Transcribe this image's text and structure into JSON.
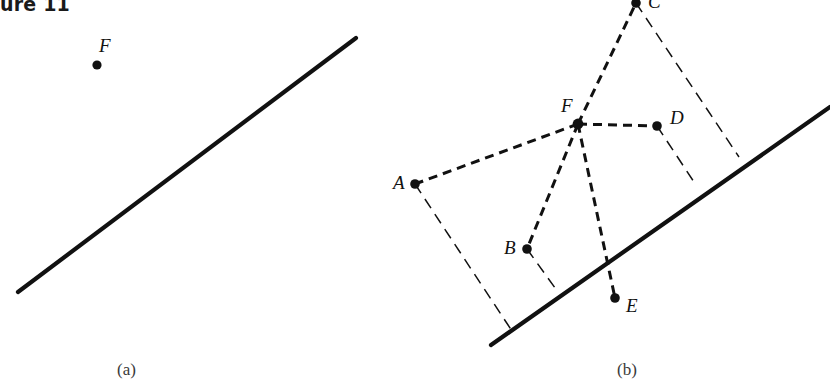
{
  "figure": {
    "title": "ure 11",
    "title_full": "Figure 11",
    "width": 830,
    "height": 388,
    "background": "#ffffff",
    "ink_color": "#111111"
  },
  "panels": [
    {
      "id": "a",
      "caption": "(a)",
      "caption_x": 117,
      "caption_y": 361,
      "line": {
        "name": "reference-line-a",
        "x1": 18,
        "y1": 292,
        "x2": 356,
        "y2": 38,
        "style": "solid",
        "width": 4.2
      },
      "points": [
        {
          "label": "F",
          "x": 97,
          "y": 65,
          "label_x": 99,
          "label_y": 36,
          "r": 4.6
        }
      ]
    },
    {
      "id": "b",
      "caption": "(b)",
      "caption_x": 617,
      "caption_y": 361,
      "line": {
        "name": "reference-line-b",
        "x1": 491,
        "y1": 345,
        "x2": 830,
        "y2": 107,
        "style": "solid",
        "width": 4.2
      },
      "points": [
        {
          "label": "A",
          "x": 415,
          "y": 184,
          "label_x": 393,
          "label_y": 173,
          "r": 4.8
        },
        {
          "label": "B",
          "x": 527,
          "y": 249,
          "label_x": 504,
          "label_y": 238,
          "r": 4.8
        },
        {
          "label": "C",
          "x": 636,
          "y": 3,
          "label_x": 648,
          "label_y": -8,
          "r": 4.8
        },
        {
          "label": "D",
          "x": 657,
          "y": 126,
          "label_x": 670,
          "label_y": 108,
          "r": 4.8
        },
        {
          "label": "E",
          "x": 615,
          "y": 298,
          "label_x": 626,
          "label_y": 296,
          "r": 4.8
        },
        {
          "label": "F",
          "x": 578,
          "y": 124,
          "label_x": 561,
          "label_y": 96,
          "r": 5.4
        }
      ],
      "rays_from_F": [
        {
          "name": "ray-F-A",
          "to": "A",
          "x1": 578,
          "y1": 124,
          "x2": 415,
          "y2": 184
        },
        {
          "name": "ray-F-B",
          "to": "B",
          "x1": 578,
          "y1": 124,
          "x2": 527,
          "y2": 249
        },
        {
          "name": "ray-F-C",
          "to": "C",
          "x1": 578,
          "y1": 124,
          "x2": 636,
          "y2": 3
        },
        {
          "name": "ray-F-D",
          "to": "D",
          "x1": 578,
          "y1": 124,
          "x2": 657,
          "y2": 126
        },
        {
          "name": "ray-F-E",
          "to": "E",
          "x1": 578,
          "y1": 124,
          "x2": 615,
          "y2": 298
        }
      ],
      "perpendiculars": [
        {
          "name": "perp-A",
          "from": "A",
          "x1": 415,
          "y1": 184,
          "x2": 512,
          "y2": 331
        },
        {
          "name": "perp-B",
          "from": "B",
          "x1": 527,
          "y1": 249,
          "x2": 558,
          "y2": 292
        },
        {
          "name": "perp-C",
          "from": "C",
          "x1": 636,
          "y1": 3,
          "x2": 739,
          "y2": 157
        },
        {
          "name": "perp-D",
          "from": "D",
          "x1": 657,
          "y1": 126,
          "x2": 694,
          "y2": 182
        }
      ]
    }
  ],
  "styles": {
    "solid_line_width": 4.2,
    "dash_line_width": 3.0,
    "dash_pattern": "9,6",
    "thin_line_width": 1.5,
    "thin_dash_pattern": "11,7"
  }
}
